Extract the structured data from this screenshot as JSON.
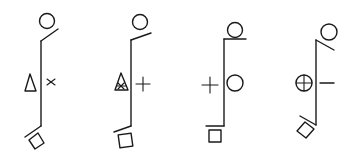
{
  "diagram": {
    "stroke_color": "#1a1a1a",
    "background": "#ffffff",
    "figures": [
      {
        "id": "figure-1",
        "top": "circle on diagonal line (rising to right)",
        "left_symbol": "triangle",
        "right_symbol": "cross-x",
        "bottom": "tilted square under diagonal line (falling to left)"
      },
      {
        "id": "figure-2",
        "top": "circle on diagonal line (rising to right)",
        "left_symbol": "hatched-triangle",
        "right_symbol": "plus",
        "bottom": "square under slight diagonal line"
      },
      {
        "id": "figure-3",
        "top": "circle on horizontal line",
        "left_symbol": "plus",
        "right_symbol": "circle",
        "bottom": "square under horizontal line"
      },
      {
        "id": "figure-4",
        "top": "circle on diagonal line (falling to right)",
        "left_symbol": "circled-plus",
        "right_symbol": "minus",
        "bottom": "tilted square under diagonal line (rising to left)"
      }
    ]
  }
}
